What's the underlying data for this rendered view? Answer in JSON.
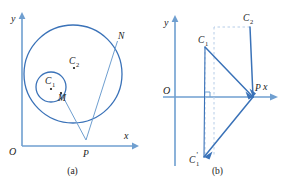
{
  "figure": {
    "title_implicit": "",
    "stroke_color": "#3a72b8",
    "axis_color": "#6f9fd0",
    "dash_color": "#aec6e4",
    "label_color": "#1a1a1a",
    "background": "#ffffff"
  },
  "panel_a": {
    "caption": "(a)",
    "axes": {
      "y_label": "y",
      "x_label": "x",
      "origin_label": "O"
    },
    "points": [
      {
        "id": "C2",
        "label": "C",
        "sub": "2",
        "prime": "",
        "x": 74,
        "y": 66
      },
      {
        "id": "C1",
        "label": "C",
        "sub": "1",
        "prime": "",
        "x": 51,
        "y": 87
      },
      {
        "id": "M",
        "label": "M",
        "sub": "",
        "prime": "",
        "x": 60,
        "y": 94
      },
      {
        "id": "N",
        "label": "N",
        "sub": "",
        "prime": "",
        "x": 117,
        "y": 40
      },
      {
        "id": "P",
        "label": "P",
        "sub": "",
        "prime": "",
        "x": 86,
        "y": 140
      }
    ],
    "circles": [
      {
        "id": "big-circle",
        "cx": 73,
        "cy": 74,
        "r": 49
      },
      {
        "id": "small-circle",
        "cx": 51,
        "cy": 87,
        "r": 15
      }
    ],
    "segments": [
      {
        "id": "P-to-M",
        "x1": 86,
        "y1": 140,
        "x2": 61,
        "y2": 93
      },
      {
        "id": "P-to-N",
        "x1": 86,
        "y1": 140,
        "x2": 117,
        "y2": 41
      }
    ]
  },
  "panel_b": {
    "caption": "(b)",
    "axes": {
      "y_label": "y",
      "x_label": "x",
      "origin_label": "O"
    },
    "points": [
      {
        "id": "C2",
        "label": "C",
        "sub": "2",
        "prime": "",
        "x": 105,
        "y": 22
      },
      {
        "id": "C1",
        "label": "C",
        "sub": "1",
        "prime": "",
        "x": 60,
        "y": 42
      },
      {
        "id": "P",
        "label": "P",
        "sub": "",
        "prime": "",
        "x": 108,
        "y": 97
      },
      {
        "id": "C1-prime",
        "label": "C",
        "sub": "1",
        "prime": "'",
        "x": 55,
        "y": 160
      }
    ],
    "segments": [
      {
        "id": "C1-to-P",
        "x1": 60,
        "y1": 47,
        "x2": 108,
        "y2": 97
      },
      {
        "id": "C2-to-P",
        "x1": 105,
        "y1": 27,
        "x2": 108,
        "y2": 97
      },
      {
        "id": "P-to-C1prime",
        "x1": 108,
        "y1": 97,
        "x2": 59,
        "y2": 157
      },
      {
        "id": "C1-to-C1prime",
        "x1": 60,
        "y1": 47,
        "x2": 59,
        "y2": 157
      }
    ],
    "dashed_segments": [
      {
        "id": "C1-drop",
        "x1": 60,
        "y1": 47,
        "x2": 60,
        "y2": 157
      },
      {
        "id": "C2-drop",
        "x1": 105,
        "y1": 27,
        "x2": 69,
        "y2": 157
      },
      {
        "id": "C1prime-up",
        "x1": 69,
        "y1": 157,
        "x2": 69,
        "y2": 27
      }
    ],
    "right_angle_mark": {
      "x": 60,
      "y": 97,
      "size": 5
    }
  }
}
